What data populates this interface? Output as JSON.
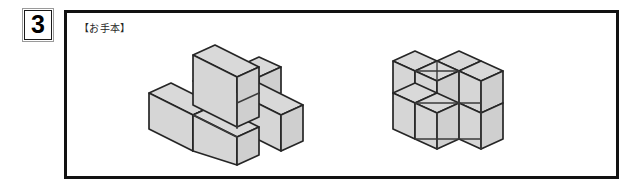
{
  "page": {
    "background_color": "#ffffff",
    "width": 639,
    "height": 191
  },
  "question": {
    "number": "3",
    "box_border_outer_color": "#9a9a9a",
    "box_border_inner_color": "#1a1a1a"
  },
  "panel": {
    "label": "【お手本】",
    "border_color": "#121212",
    "background_color": "#ffffff"
  },
  "figures": {
    "shading": {
      "top_face_color": "#d9d9d9",
      "left_face_color": "#d6d6d6",
      "right_face_color": "#cfcfcf",
      "outline_color": "#262626",
      "inner_line_color": "#3a3a3a"
    },
    "items": [
      {
        "name": "plus-shaped-cube-figure",
        "description": "isometric arrangement of unit cubes forming a plus/cross with one raised cube",
        "cube_count": 6
      },
      {
        "name": "stacked-block-cube-figure",
        "description": "isometric arrangement of unit cubes forming a 2x2x2 style stacked block",
        "cube_count": 8
      }
    ]
  }
}
